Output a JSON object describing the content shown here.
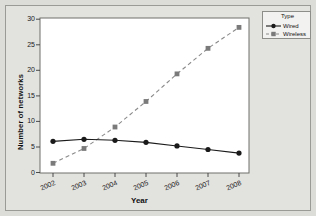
{
  "chart_data": {
    "type": "line",
    "title": "",
    "xlabel": "Year",
    "ylabel": "Number of networks",
    "categories": [
      "2002",
      "2003",
      "2004",
      "2005",
      "2006",
      "2007",
      "2008"
    ],
    "x": [
      2002,
      2003,
      2004,
      2005,
      2006,
      2007,
      2008
    ],
    "xlim": [
      2001.6,
      2008.4
    ],
    "ylim": [
      0,
      30
    ],
    "yticks": [
      0,
      5,
      10,
      15,
      20,
      25,
      30
    ],
    "grid": false,
    "legend_position": "right-top",
    "legend_title": "Type",
    "series": [
      {
        "name": "Wired",
        "values": [
          6.1,
          6.5,
          6.3,
          5.9,
          5.2,
          4.5,
          3.8
        ],
        "color": "#1a1a1a",
        "marker": "circle",
        "linestyle": "solid"
      },
      {
        "name": "Wireless",
        "values": [
          1.8,
          4.7,
          8.9,
          13.9,
          19.3,
          24.3,
          28.4
        ],
        "color": "#7a7a7a",
        "marker": "square",
        "linestyle": "dashed"
      }
    ]
  },
  "axes": {
    "ytick_labels": [
      "0",
      "5",
      "10",
      "15",
      "20",
      "25",
      "30"
    ],
    "xtick_labels": [
      "2002",
      "2003",
      "2004",
      "2005",
      "2006",
      "2007",
      "2008"
    ],
    "y_axis_title": "Number of networks",
    "x_axis_title": "Year"
  },
  "legend": {
    "title": "Type",
    "items": [
      {
        "label": "Wired"
      },
      {
        "label": "Wireless"
      }
    ]
  },
  "colors": {
    "background": "#dcdcd9",
    "panel": "#ffffff",
    "frame": "#9a9a96",
    "wired": "#1a1a1a",
    "wireless": "#7a7a7a"
  }
}
